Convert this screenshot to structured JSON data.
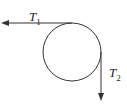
{
  "diagram": {
    "labels": {
      "t1": {
        "main": "T",
        "sub": "1"
      },
      "t2": {
        "main": "T",
        "sub": "2"
      }
    },
    "colors": {
      "stroke": "#333333",
      "background": "#ffffff"
    }
  }
}
